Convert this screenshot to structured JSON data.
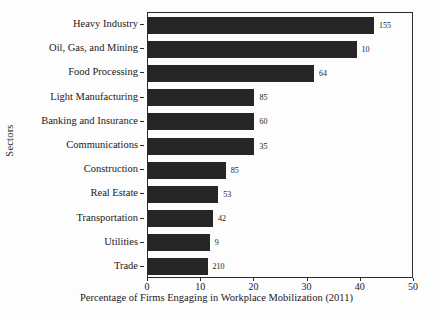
{
  "chart_data": {
    "type": "bar",
    "orientation": "horizontal",
    "title": "",
    "xlabel": "Percentage of Firms Engaging in Workplace Mobilization (2011)",
    "ylabel": "Sectors",
    "xlim": [
      0,
      50
    ],
    "xticks": [
      0,
      10,
      20,
      30,
      40,
      50
    ],
    "xticklabels": [
      "0",
      "10",
      "20",
      "30",
      "40",
      "50"
    ],
    "grid": false,
    "legend": false,
    "categories": [
      "Heavy Industry",
      "Oil, Gas, and Mining",
      "Food Processing",
      "Light Manufacturing",
      "Banking and Insurance",
      "Communications",
      "Construction",
      "Real Estate",
      "Transportation",
      "Utilities",
      "Trade"
    ],
    "values": [
      42.5,
      39.2,
      31.2,
      20.0,
      20.0,
      20.0,
      14.6,
      13.2,
      12.2,
      11.6,
      11.2
    ],
    "point_labels": [
      "155",
      "10",
      "64",
      "85",
      "60",
      "35",
      "85",
      "53",
      "42",
      "9",
      "210"
    ],
    "bar_color": "#262626",
    "axis_color": "#2b2b2b",
    "background_color": "#fdfdfd"
  }
}
